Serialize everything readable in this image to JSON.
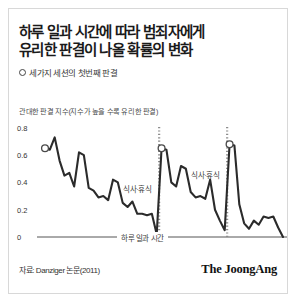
{
  "card": {
    "title_lines": [
      "하루 일과 시간에 따라 범죄자에게",
      "유리한 판결이 나올 확률의 변화"
    ],
    "legend": {
      "marker_icon": "hollow-circle-icon",
      "label": "세가지 세션의 첫번째 판결"
    },
    "y_axis_caption": "관대한 판결 지수(지수가 높을 수록 유리한 판결)",
    "footer": {
      "source": "자료: Danziger 논문(2011)",
      "brand": "The JoongAng"
    }
  },
  "colors": {
    "line": "#2b2b2b",
    "axis": "#555555",
    "text": "#1a1a1a",
    "muted_text": "#3a3a3a",
    "marker_stroke": "#4a4a4a",
    "dotted_divider": "#8c8c8c",
    "card_border": "#d8d8d8",
    "background": "#ffffff"
  },
  "chart_data": {
    "type": "line",
    "title": "하루 일과 시간에 따라 범죄자에게 유리한 판결이 나올 확률의 변화",
    "xlabel": "하루 일과 시간",
    "ylabel": "관대한 판결 지수(지수가 높을 수록 유리한 판결)",
    "ylim": [
      0,
      0.85
    ],
    "ytick_labels": [
      "0.8",
      "0.6",
      "0.4",
      "0.2",
      "0"
    ],
    "ytick_values": [
      0.8,
      0.6,
      0.4,
      0.2,
      0
    ],
    "grid": false,
    "legend_position": "top-left",
    "series": [
      {
        "name": "관대한 판결 지수",
        "x": [
          0,
          1,
          2,
          3,
          4,
          5,
          6,
          7,
          8,
          9,
          10,
          11,
          12,
          13,
          14,
          15,
          16,
          17,
          18,
          19,
          20,
          21,
          22,
          23,
          24,
          25,
          26,
          27,
          28,
          29,
          30,
          31,
          32,
          33,
          34,
          35,
          36,
          37,
          38,
          39,
          40,
          41,
          42,
          43,
          44,
          45,
          46,
          47,
          48,
          49
        ],
        "values": [
          0.65,
          0.64,
          0.73,
          0.56,
          0.45,
          0.47,
          0.37,
          0.62,
          0.6,
          0.36,
          0.34,
          0.29,
          0.3,
          0.27,
          0.42,
          0.4,
          0.25,
          0.22,
          0.26,
          0.17,
          0.17,
          0.16,
          0.17,
          0.02,
          0.65,
          0.64,
          0.4,
          0.37,
          0.52,
          0.5,
          0.33,
          0.29,
          0.3,
          0.28,
          0.42,
          0.2,
          0.12,
          0.05,
          0.68,
          0.67,
          0.24,
          0.1,
          0.06,
          0.12,
          0.09,
          0.15,
          0.14,
          0.15,
          0.07,
          0.0
        ]
      }
    ],
    "markers": [
      {
        "name": "session-1-first-ruling",
        "x": 0,
        "y": 0.65
      },
      {
        "name": "session-2-first-ruling",
        "x": 24,
        "y": 0.65
      },
      {
        "name": "session-3-first-ruling",
        "x": 38,
        "y": 0.68
      }
    ],
    "annotations": [
      {
        "name": "break-1",
        "label": "식사·휴식",
        "x": 23.5
      },
      {
        "name": "break-2",
        "label": "식사·휴식",
        "x": 37.5
      }
    ]
  }
}
